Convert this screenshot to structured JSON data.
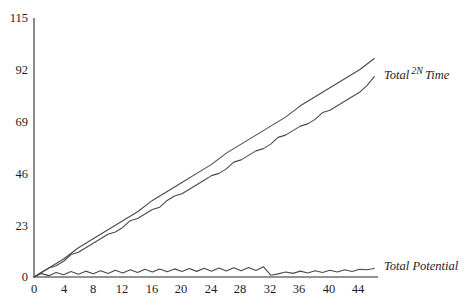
{
  "chart_data": {
    "type": "line",
    "title": "",
    "xlabel": "",
    "ylabel": "",
    "xlim": [
      0,
      46.5
    ],
    "ylim": [
      0,
      115
    ],
    "grid": false,
    "legend_position": "inline-right",
    "xticks": [
      0,
      4,
      8,
      12,
      16,
      20,
      24,
      28,
      32,
      36,
      40,
      44
    ],
    "yticks": [
      0,
      23,
      46,
      69,
      92,
      115
    ],
    "series": [
      {
        "name": "2N",
        "label_prefix": "Total",
        "label_sup": "2N",
        "label_suffix": "Time",
        "x": [
          0,
          2,
          4,
          6,
          8,
          10,
          12,
          14,
          16,
          18,
          20,
          22,
          24,
          26,
          28,
          30,
          32,
          34,
          36,
          38,
          40,
          42,
          44,
          46
        ],
        "values": [
          0,
          4,
          8,
          13,
          17,
          21,
          25,
          29,
          34,
          38,
          42,
          46,
          50,
          55,
          59,
          63,
          67,
          71,
          76,
          80,
          84,
          88,
          92,
          97
        ]
      },
      {
        "name": "Total Time",
        "x": [
          0,
          1,
          2,
          3,
          4,
          5,
          6,
          7,
          8,
          9,
          10,
          11,
          12,
          13,
          14,
          15,
          16,
          17,
          18,
          19,
          20,
          21,
          22,
          23,
          24,
          25,
          26,
          27,
          28,
          29,
          30,
          31,
          32,
          33,
          34,
          35,
          36,
          37,
          38,
          39,
          40,
          41,
          42,
          43,
          44,
          45,
          46
        ],
        "values": [
          0,
          2,
          4,
          5,
          7,
          10,
          11,
          13,
          15,
          17,
          19,
          20,
          22,
          25,
          26,
          28,
          30,
          31,
          34,
          36,
          37,
          39,
          41,
          43,
          45,
          46,
          48,
          51,
          52,
          54,
          56,
          57,
          59,
          62,
          63,
          65,
          67,
          68,
          70,
          73,
          74,
          76,
          78,
          80,
          82,
          85,
          89
        ]
      },
      {
        "name": "Total Potential",
        "x": [
          0,
          1,
          2,
          3,
          4,
          5,
          6,
          7,
          8,
          9,
          10,
          11,
          12,
          13,
          14,
          15,
          16,
          17,
          18,
          19,
          20,
          21,
          22,
          23,
          24,
          25,
          26,
          27,
          28,
          29,
          30,
          31,
          32,
          33,
          34,
          35,
          36,
          37,
          38,
          39,
          40,
          41,
          42,
          43,
          44,
          45,
          46
        ],
        "values": [
          0,
          1.5,
          0.6,
          2.0,
          1.0,
          2.4,
          1.2,
          2.6,
          1.4,
          2.8,
          1.6,
          3.0,
          1.8,
          3.2,
          2.0,
          3.4,
          2.2,
          3.6,
          2.3,
          3.6,
          2.4,
          3.8,
          2.5,
          3.9,
          2.6,
          4.0,
          2.7,
          4.1,
          2.8,
          4.2,
          2.9,
          4.6,
          0.8,
          1.4,
          2.2,
          1.6,
          2.6,
          1.8,
          2.8,
          2.0,
          3.0,
          2.2,
          3.2,
          2.4,
          3.4,
          3.2,
          3.8
        ]
      }
    ],
    "colors": {
      "axis": "#6f6f6f",
      "line": "#4a4a4a",
      "background": "#ffffff",
      "text": "#1d1d1d"
    }
  },
  "labels": {
    "total_time": {
      "prefix": "Total",
      "sup": "2N",
      "suffix": "Time"
    },
    "total_potential": "Total Potential"
  },
  "yticks": {
    "t0": "0",
    "t1": "23",
    "t2": "46",
    "t3": "69",
    "t4": "92",
    "t5": "115"
  },
  "xticks": {
    "t0": "0",
    "t1": "4",
    "t2": "8",
    "t3": "12",
    "t4": "16",
    "t5": "20",
    "t6": "24",
    "t7": "28",
    "t8": "32",
    "t9": "36",
    "t10": "40",
    "t11": "44"
  }
}
